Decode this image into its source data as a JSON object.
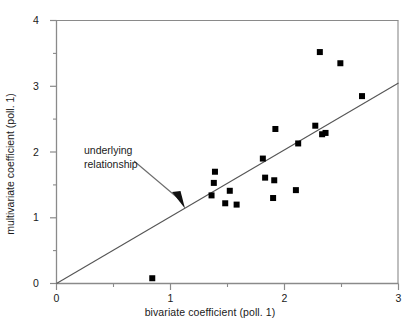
{
  "chart_data": {
    "type": "scatter",
    "title": "",
    "xlabel": "bivariate coefficient (poll. 1)",
    "ylabel": "multivariate coefficient (poll. 1)",
    "xlim": [
      0,
      3
    ],
    "ylim": [
      0,
      4
    ],
    "xticks": [
      "0",
      "1",
      "2",
      "3"
    ],
    "xtick_values": [
      0,
      1,
      2,
      3
    ],
    "yticks": [
      "0",
      "1",
      "2",
      "3",
      "4"
    ],
    "ytick_values": [
      0,
      1,
      2,
      3,
      4
    ],
    "xminor_step": 0.5,
    "yminor_step": 0.5,
    "grid": false,
    "legend": false,
    "marker": "square",
    "marker_color": "#000000",
    "marker_size": 6,
    "series": [
      {
        "name": "observed coefficients",
        "points": [
          [
            0.84,
            0.08
          ],
          [
            1.36,
            1.34
          ],
          [
            1.38,
            1.53
          ],
          [
            1.39,
            1.7
          ],
          [
            1.48,
            1.22
          ],
          [
            1.52,
            1.41
          ],
          [
            1.58,
            1.2
          ],
          [
            1.81,
            1.9
          ],
          [
            1.83,
            1.61
          ],
          [
            1.9,
            1.3
          ],
          [
            1.91,
            1.57
          ],
          [
            1.92,
            2.35
          ],
          [
            2.1,
            1.42
          ],
          [
            2.12,
            2.13
          ],
          [
            2.27,
            2.4
          ],
          [
            2.31,
            3.52
          ],
          [
            2.33,
            2.27
          ],
          [
            2.36,
            2.29
          ],
          [
            2.49,
            3.35
          ],
          [
            2.68,
            2.85
          ]
        ]
      }
    ],
    "reference_line": {
      "label": "underlying relationship",
      "from": [
        0.0,
        0.0
      ],
      "to": [
        3.0,
        3.05
      ],
      "color": "#555555"
    },
    "annotation": {
      "text_line1": "underlying",
      "text_line2": "relationship",
      "arrow_from": [
        0.68,
        1.85
      ],
      "arrow_to": [
        1.07,
        1.18
      ]
    }
  },
  "axes": {
    "frame_color": "#8a8a8a",
    "text_color": "#1a1a1a"
  }
}
